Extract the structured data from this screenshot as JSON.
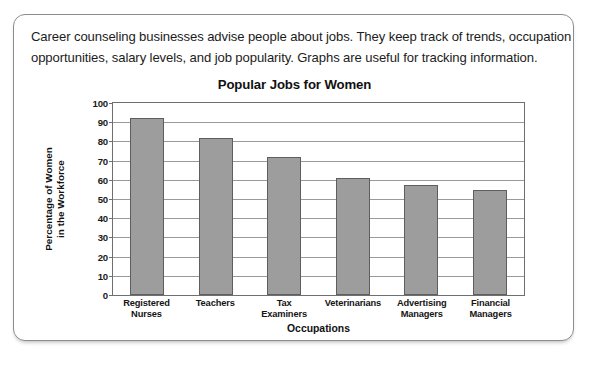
{
  "intro": {
    "line1": "Career counseling businesses advise people about jobs. They keep track of trends, occupation",
    "line2": "opportunities, salary levels, and job popularity. Graphs are useful for tracking information."
  },
  "chart_data": {
    "type": "bar",
    "title": "Popular Jobs for Women",
    "xlabel": "Occupations",
    "ylabel_line1": "Percentage of Women",
    "ylabel_line2": "in the Workforce",
    "categories": [
      "Registered\nNurses",
      "Teachers",
      "Tax\nExaminers",
      "Veterinarians",
      "Advertising\nManagers",
      "Financial\nManagers"
    ],
    "category_lines": [
      [
        "Registered",
        "Nurses"
      ],
      [
        "Teachers",
        ""
      ],
      [
        "Tax",
        "Examiners"
      ],
      [
        "Veterinarians",
        ""
      ],
      [
        "Advertising",
        "Managers"
      ],
      [
        "Financial",
        "Managers"
      ]
    ],
    "values": [
      92,
      82,
      72,
      61,
      57.5,
      54.5
    ],
    "ylim": [
      0,
      100
    ],
    "yticks": [
      100,
      90,
      80,
      70,
      60,
      50,
      40,
      30,
      20,
      10,
      0
    ],
    "grid": true,
    "legend": "none",
    "bar_color": "#9d9d9d",
    "bar_border_color": "#5e5e5e",
    "grid_color": "#9a9a9a",
    "axis_color": "#6f6f6f"
  }
}
